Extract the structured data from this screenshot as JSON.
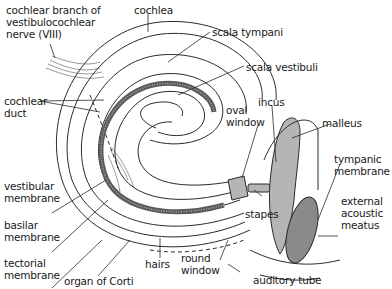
{
  "diagram": {
    "labels": {
      "nerve": "cochlear branch of\nvestibulocochlear\nnerve (VIII)",
      "cochlea": "cochlea",
      "scala_tympani": "scala tympani",
      "scala_vestibuli": "scala vestibuli",
      "cochlear_duct": "cochlear\nduct",
      "incus": "incus",
      "oval_window": "oval\nwindow",
      "malleus": "malleus",
      "tympanic_membrane": "tympanic\nmembrane",
      "vestibular_membrane": "vestibular\nmembrane",
      "external_acoustic_meatus": "external\nacoustic\nmeatus",
      "stapes": "stapes",
      "basilar_membrane": "basilar\nmembrane",
      "tectorial_membrane": "tectorial\nmembrane",
      "hairs": "hairs",
      "round_window": "round\nwindow",
      "organ_of_corti": "organ of Corti",
      "auditory_tube": "auditory tube"
    },
    "colors": {
      "line": "#2a2a2a",
      "duct_fill": "#6e6e6e",
      "ossicle_fill": "#b5b5b5",
      "membrane_fill": "#8a8a8a"
    }
  }
}
